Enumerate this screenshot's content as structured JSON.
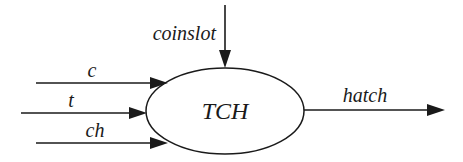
{
  "diagram": {
    "type": "context-diagram",
    "process": {
      "label": "TCH",
      "shape": "ellipse"
    },
    "inputs": [
      {
        "label": "c",
        "direction": "in",
        "from": "left"
      },
      {
        "label": "t",
        "direction": "in",
        "from": "left"
      },
      {
        "label": "ch",
        "direction": "in",
        "from": "left"
      },
      {
        "label": "coinslot",
        "direction": "in",
        "from": "top"
      }
    ],
    "outputs": [
      {
        "label": "hatch",
        "direction": "out",
        "to": "right"
      }
    ],
    "colors": {
      "ink": "#1a1a1a",
      "background": "#ffffff"
    }
  }
}
